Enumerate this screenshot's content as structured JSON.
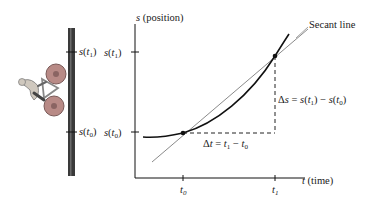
{
  "figure": {
    "type": "secant-line-position-diagram",
    "pole_labels": {
      "upper": "s(t1)",
      "lower": "s(t0)"
    },
    "axes": {
      "y_label": "s (position)",
      "x_label": "t (time)",
      "y_ticks": [
        "s(t1)",
        "s(t0)"
      ],
      "x_ticks": [
        "t0",
        "t1"
      ]
    },
    "annotations": {
      "secant": "Secant line",
      "delta_t": "Δt = t1 − t0",
      "delta_s": "Δs = s(t1) − s(t0)"
    },
    "icons": {
      "cyclist": "bicycle-rider-icon"
    },
    "colors": {
      "curve": "#111111",
      "secant": "#8a8a8a",
      "pole": "#3a3a3a",
      "wheel": "#a87a7a"
    }
  }
}
